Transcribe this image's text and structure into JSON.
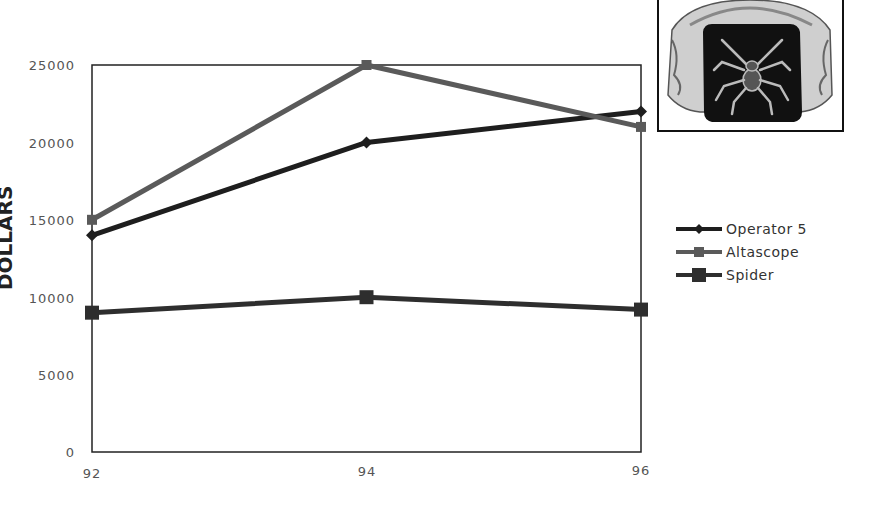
{
  "chart_data": {
    "type": "line",
    "title": "",
    "xlabel": "",
    "ylabel": "DOLLARS",
    "x": [
      "92",
      "94",
      "96"
    ],
    "categories": [
      "92",
      "94",
      "96"
    ],
    "ylim": [
      0,
      25000
    ],
    "yticks": [
      0,
      5000,
      10000,
      15000,
      20000,
      25000
    ],
    "ytick_labels": [
      "0",
      "5000",
      "10000",
      "15000",
      "20000",
      "25000"
    ],
    "grid": false,
    "legend_position": "right",
    "series": [
      {
        "name": "Operator 5",
        "values": [
          14000,
          20000,
          22000
        ],
        "color": "#1e1e1e",
        "marker": "diamond"
      },
      {
        "name": "Altascope",
        "values": [
          15000,
          25000,
          21000
        ],
        "color": "#5a5a5a",
        "marker": "square"
      },
      {
        "name": "Spider",
        "values": [
          9000,
          10000,
          9200
        ],
        "color": "#2e2e2e",
        "marker": "large-square"
      }
    ]
  },
  "legend": {
    "items": [
      {
        "label": "Operator 5"
      },
      {
        "label": "Altascope"
      },
      {
        "label": "Spider"
      }
    ]
  },
  "image": {
    "name": "spider-ring-photo"
  },
  "axis": {
    "y_ticks": [
      "25000",
      "20000",
      "15000",
      "10000",
      "5000",
      "0"
    ],
    "x_ticks": [
      "92",
      "94",
      "96"
    ]
  }
}
